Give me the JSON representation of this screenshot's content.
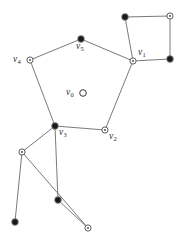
{
  "figure": {
    "width": 192,
    "height": 244,
    "background_color": "#ffffff",
    "edge_color": "#6b6b6b",
    "filled_node_color": "#1a1a1a",
    "hollow_node_color": "#ffffff",
    "node_stroke_color": "#4a4a4a"
  },
  "chart_data": {
    "type": "diagram",
    "xlabel": "",
    "ylabel": "",
    "xlim": [
      0,
      192
    ],
    "ylim": [
      0,
      244
    ],
    "grid": false,
    "legend": "none",
    "node_styles": {
      "filled": "solid black disc",
      "target": "hollow circle with centre dot",
      "plain": "plain hollow circle"
    },
    "nodes": [
      {
        "id": "v0",
        "label": "v",
        "sub": "0",
        "x": 83,
        "y": 93,
        "style": "plain",
        "label_pos": "left"
      },
      {
        "id": "v1",
        "label": "v",
        "sub": "1",
        "x": 133,
        "y": 61,
        "style": "target",
        "label_pos": "upper-right"
      },
      {
        "id": "v2",
        "label": "v",
        "sub": "2",
        "x": 105,
        "y": 130,
        "style": "target",
        "label_pos": "lower-right"
      },
      {
        "id": "v3",
        "label": "v",
        "sub": "3",
        "x": 55,
        "y": 126,
        "style": "filled",
        "label_pos": "lower-right"
      },
      {
        "id": "v4",
        "label": "v",
        "sub": "4",
        "x": 30,
        "y": 60,
        "style": "target",
        "label_pos": "left"
      },
      {
        "id": "v5",
        "label": "v",
        "sub": "5",
        "x": 81,
        "y": 39,
        "style": "filled",
        "label_pos": "below"
      },
      {
        "id": "q1",
        "label": "",
        "sub": "",
        "x": 125,
        "y": 17,
        "style": "filled",
        "label_pos": "none"
      },
      {
        "id": "q2",
        "label": "",
        "sub": "",
        "x": 170,
        "y": 16,
        "style": "target",
        "label_pos": "none"
      },
      {
        "id": "q3",
        "label": "",
        "sub": "",
        "x": 170,
        "y": 59,
        "style": "filled",
        "label_pos": "none"
      },
      {
        "id": "b1",
        "label": "",
        "sub": "",
        "x": 22,
        "y": 152,
        "style": "target",
        "label_pos": "none"
      },
      {
        "id": "b2",
        "label": "",
        "sub": "",
        "x": 15,
        "y": 222,
        "style": "filled",
        "label_pos": "none"
      },
      {
        "id": "b3",
        "label": "",
        "sub": "",
        "x": 58,
        "y": 200,
        "style": "filled",
        "label_pos": "none"
      },
      {
        "id": "b4",
        "label": "",
        "sub": "",
        "x": 88,
        "y": 228,
        "style": "target",
        "label_pos": "none"
      }
    ],
    "edges": [
      {
        "from": "v4",
        "to": "v5"
      },
      {
        "from": "v5",
        "to": "v1"
      },
      {
        "from": "v1",
        "to": "v2"
      },
      {
        "from": "v2",
        "to": "v3"
      },
      {
        "from": "v3",
        "to": "v4"
      },
      {
        "from": "v1",
        "to": "q1"
      },
      {
        "from": "q1",
        "to": "q2"
      },
      {
        "from": "q2",
        "to": "q3"
      },
      {
        "from": "q3",
        "to": "v1"
      },
      {
        "from": "v3",
        "to": "b1"
      },
      {
        "from": "b1",
        "to": "b2"
      },
      {
        "from": "b1",
        "to": "b4"
      },
      {
        "from": "v3",
        "to": "b3"
      },
      {
        "from": "b3",
        "to": "b4"
      }
    ],
    "counts": {
      "nodes": 13,
      "edges": 14,
      "labelled_nodes": 6
    }
  }
}
